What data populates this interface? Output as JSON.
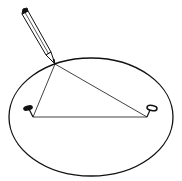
{
  "diagram": {
    "colors": {
      "background": "#ffffff",
      "stroke": "#111111"
    },
    "ellipse": {
      "cx": 91,
      "cy": 117,
      "rx": 82,
      "ry": 59
    },
    "pencil_tip": {
      "x": 55,
      "y": 64
    },
    "pins": [
      {
        "label": "pin-left",
        "x": 30,
        "y": 108
      },
      {
        "label": "pin-right",
        "x": 151,
        "y": 108
      }
    ],
    "string_base": {
      "x1": 33,
      "y1": 117,
      "x2": 147,
      "y2": 117
    }
  }
}
